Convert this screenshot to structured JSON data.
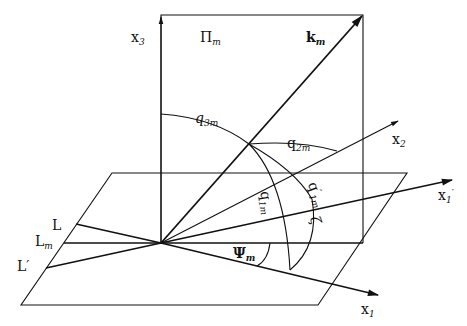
{
  "diagram": {
    "type": "3d-geometry-vector-angles",
    "colors": {
      "stroke": "#111111",
      "background": "#ffffff"
    },
    "labels": {
      "x3": {
        "base": "x",
        "sub": "3"
      },
      "plane": {
        "base": "Π",
        "sub": "m"
      },
      "k": {
        "base": "k",
        "sub": "m"
      },
      "q3": {
        "base": "q",
        "sub": "3m"
      },
      "q2": {
        "base": "q",
        "sub": "2m"
      },
      "x2": {
        "base": "x",
        "sub": "2"
      },
      "q1": {
        "base": "q",
        "sub": "1m"
      },
      "q1p": {
        "base": "q",
        "sup": "′",
        "sub": "1m"
      },
      "zeta": {
        "base": "ζ"
      },
      "x1p": {
        "base": "x",
        "sub": "1",
        "sup": "′"
      },
      "L": {
        "base": "L"
      },
      "Lm": {
        "base": "L",
        "sub": "m"
      },
      "Lp": {
        "base": "L′"
      },
      "psi": {
        "base": "Ψ",
        "sub": "m"
      },
      "x1": {
        "base": "x",
        "sub": "1"
      }
    }
  }
}
